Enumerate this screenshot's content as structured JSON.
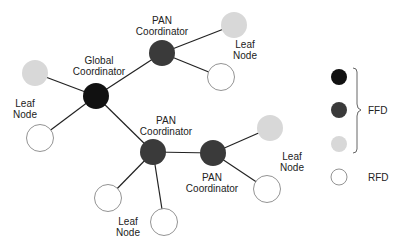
{
  "diagram": {
    "colors": {
      "global_coordinator": "#111111",
      "pan_coordinator": "#3a3a3a",
      "ffd_leaf": "#d8d8d8",
      "rfd_leaf": "#ffffff",
      "edge": "#222222"
    },
    "labels": {
      "global_line1": "Global",
      "global_line2": "Coordinator",
      "pan_top_line1": "PAN",
      "pan_top_line2": "Coordinator",
      "pan_mid_line1": "PAN",
      "pan_mid_line2": "Coordinator",
      "pan_right_line1": "PAN",
      "pan_right_line2": "Coordinator",
      "leaf_top_line1": "Leaf",
      "leaf_top_line2": "Node",
      "leaf_left_line1": "Leaf",
      "leaf_left_line2": "Node",
      "leaf_right_line1": "Leaf",
      "leaf_right_line2": "Node",
      "leaf_bottom_line1": "Leaf",
      "leaf_bottom_line2": "Node"
    },
    "nodes": [
      {
        "id": "global",
        "type": "global_coordinator"
      },
      {
        "id": "pan_top",
        "type": "pan_coordinator"
      },
      {
        "id": "pan_mid",
        "type": "pan_coordinator"
      },
      {
        "id": "pan_right",
        "type": "pan_coordinator"
      },
      {
        "id": "leaf_top_gray",
        "type": "ffd_leaf"
      },
      {
        "id": "leaf_top_white",
        "type": "rfd_leaf"
      },
      {
        "id": "leaf_left_gray",
        "type": "ffd_leaf"
      },
      {
        "id": "leaf_left_white",
        "type": "rfd_leaf"
      },
      {
        "id": "leaf_right_gray",
        "type": "ffd_leaf"
      },
      {
        "id": "leaf_right_white",
        "type": "rfd_leaf"
      },
      {
        "id": "leaf_bottom_1",
        "type": "rfd_leaf"
      },
      {
        "id": "leaf_bottom_2",
        "type": "rfd_leaf"
      }
    ],
    "edges": [
      [
        "global",
        "pan_top"
      ],
      [
        "global",
        "pan_mid"
      ],
      [
        "global",
        "leaf_left_gray"
      ],
      [
        "global",
        "leaf_left_white"
      ],
      [
        "pan_top",
        "leaf_top_gray"
      ],
      [
        "pan_top",
        "leaf_top_white"
      ],
      [
        "pan_mid",
        "pan_right"
      ],
      [
        "pan_mid",
        "leaf_bottom_1"
      ],
      [
        "pan_mid",
        "leaf_bottom_2"
      ],
      [
        "pan_right",
        "leaf_right_gray"
      ],
      [
        "pan_right",
        "leaf_right_white"
      ]
    ]
  },
  "legend": {
    "ffd_label": "FFD",
    "rfd_label": "RFD",
    "items": [
      {
        "swatch": "black",
        "group": "FFD"
      },
      {
        "swatch": "dark-gray",
        "group": "FFD"
      },
      {
        "swatch": "light-gray",
        "group": "FFD"
      },
      {
        "swatch": "white",
        "group": "RFD"
      }
    ]
  }
}
